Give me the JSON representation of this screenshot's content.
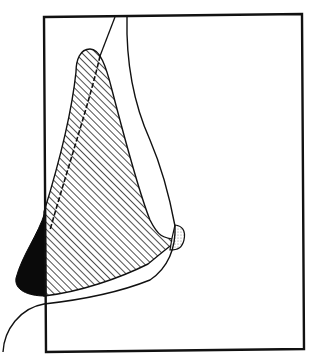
{
  "diagram": {
    "type": "line-drawing",
    "description": "Profile outline of a nose within a rectangular frame; hatched region with solid black tip area and a small stippled patch near the nostril",
    "colors": {
      "background": "#ffffff",
      "stroke": "#111111",
      "fill_black": "#0a0a0a",
      "hatch": "#222222",
      "stipple": "#999999"
    },
    "frame": {
      "top_left": [
        44,
        17
      ],
      "top_right": [
        302,
        14
      ],
      "bottom_right": [
        304,
        349
      ],
      "bottom_left": [
        46,
        352
      ]
    },
    "regions": [
      {
        "name": "hatched-area",
        "pattern": "diagonal-hatch"
      },
      {
        "name": "black-tip-area",
        "pattern": "solid"
      },
      {
        "name": "stippled-nostril-patch",
        "pattern": "dots"
      }
    ],
    "labels": []
  }
}
